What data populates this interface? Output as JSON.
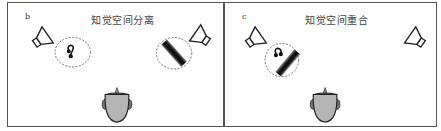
{
  "figure": {
    "panels": [
      {
        "label": "b",
        "title": "知觉空间分离",
        "sources": [
          {
            "type": "music-note",
            "speaker": "left"
          },
          {
            "type": "noise-bar",
            "speaker": "right"
          }
        ]
      },
      {
        "label": "c",
        "title": "知觉空间重合",
        "sources": [
          {
            "type": "music-note",
            "speaker": "left"
          },
          {
            "type": "noise-bar",
            "speaker": "left"
          }
        ]
      }
    ],
    "colors": {
      "border": "#555555",
      "head_fill": "#b5b5b5",
      "outline": "#222222",
      "dashed_circle": "#666666"
    }
  }
}
